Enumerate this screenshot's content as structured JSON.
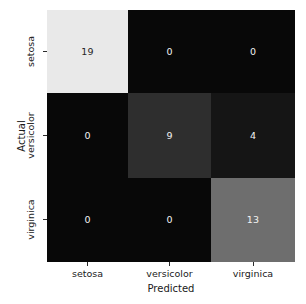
{
  "chart_data": {
    "type": "heatmap",
    "title": "",
    "xlabel": "Predicted",
    "ylabel": "Actual",
    "xticklabels": [
      "setosa",
      "versicolor",
      "virginica"
    ],
    "yticklabels": [
      "setosa",
      "versicolor",
      "virginica"
    ],
    "categories": [
      "setosa",
      "versicolor",
      "virginica"
    ],
    "colormap": "gray",
    "grid": false,
    "legend": false,
    "colorbar": false,
    "annotated": true,
    "vmin": 0,
    "vmax": 19,
    "matrix": [
      [
        19,
        0,
        0
      ],
      [
        0,
        9,
        4
      ],
      [
        0,
        0,
        13
      ]
    ],
    "rows": [
      {
        "actual": "setosa",
        "cells": [
          {
            "predicted": "setosa",
            "value": "19",
            "fill": "#e9e9e9",
            "text_color": "#262626"
          },
          {
            "predicted": "versicolor",
            "value": "0",
            "fill": "#080808",
            "text_color": "#f2f2f2"
          },
          {
            "predicted": "virginica",
            "value": "0",
            "fill": "#080808",
            "text_color": "#f2f2f2"
          }
        ]
      },
      {
        "actual": "versicolor",
        "cells": [
          {
            "predicted": "setosa",
            "value": "0",
            "fill": "#080808",
            "text_color": "#f2f2f2"
          },
          {
            "predicted": "versicolor",
            "value": "9",
            "fill": "#2e2e2e",
            "text_color": "#f2f2f2"
          },
          {
            "predicted": "virginica",
            "value": "4",
            "fill": "#151515",
            "text_color": "#f2f2f2"
          }
        ]
      },
      {
        "actual": "virginica",
        "cells": [
          {
            "predicted": "setosa",
            "value": "0",
            "fill": "#080808",
            "text_color": "#f2f2f2"
          },
          {
            "predicted": "versicolor",
            "value": "0",
            "fill": "#080808",
            "text_color": "#f2f2f2"
          },
          {
            "predicted": "virginica",
            "value": "13",
            "fill": "#6e6e6e",
            "text_color": "#f2f2f2"
          }
        ]
      }
    ]
  }
}
